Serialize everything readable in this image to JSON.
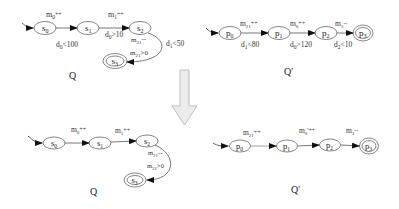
{
  "arrow": {
    "direction": "down",
    "color": "#e6e6e6",
    "stroke": "#aaaaaa"
  },
  "top_left": {
    "caption": "Q",
    "states": [
      {
        "id": "s0",
        "label": "s",
        "sub": "0",
        "x": 45,
        "y": 28,
        "final": false,
        "initial": true
      },
      {
        "id": "s1",
        "label": "s",
        "sub": "1",
        "x": 88,
        "y": 28,
        "final": false
      },
      {
        "id": "s2",
        "label": "s",
        "sub": "2",
        "x": 140,
        "y": 28,
        "final": false
      },
      {
        "id": "s3",
        "label": "s",
        "sub": "3",
        "x": 115,
        "y": 61,
        "final": true
      }
    ],
    "edges": [
      {
        "from": "s0",
        "to": "s1",
        "top": "m0++",
        "bottom": "d0<100"
      },
      {
        "from": "s1",
        "to": "s2",
        "top": "m1++",
        "bottom": "d0>10"
      },
      {
        "from": "s2",
        "to": "s3",
        "labels": [
          "m21--",
          "m21>0"
        ],
        "side": "d1<50"
      }
    ]
  },
  "top_right": {
    "caption": "Q'",
    "states": [
      {
        "id": "p0",
        "label": "p",
        "sub": "0",
        "x": 230,
        "y": 33,
        "initial": true
      },
      {
        "id": "p1",
        "label": "p",
        "sub": "1",
        "x": 279,
        "y": 33
      },
      {
        "id": "p2",
        "label": "p",
        "sub": "2",
        "x": 326,
        "y": 33
      },
      {
        "id": "p3",
        "label": "p",
        "sub": "3",
        "x": 363,
        "y": 33,
        "final": true
      }
    ],
    "edges": [
      {
        "from": "p0",
        "to": "p1",
        "top": "m21++",
        "bottom": "d1<80"
      },
      {
        "from": "p1",
        "to": "p2",
        "top": "m0++",
        "bottom": "d0>120"
      },
      {
        "from": "p2",
        "to": "p3",
        "top": "m3--",
        "bottom": "d2<10"
      }
    ]
  },
  "bottom_left": {
    "caption": "Q",
    "states": [
      {
        "id": "s0",
        "label": "s",
        "sub": "0",
        "x": 54,
        "y": 143,
        "initial": true
      },
      {
        "id": "s1",
        "label": "s",
        "sub": "1",
        "x": 100,
        "y": 143
      },
      {
        "id": "s2",
        "label": "s",
        "sub": "2",
        "x": 147,
        "y": 141
      },
      {
        "id": "s3",
        "label": "s",
        "sub": "3",
        "x": 135,
        "y": 180,
        "final": true
      }
    ],
    "edges": [
      {
        "from": "s0",
        "to": "s1",
        "top": "m0++"
      },
      {
        "from": "s1",
        "to": "s2",
        "top": "m1++"
      },
      {
        "from": "s2",
        "to": "s3",
        "labels": [
          "m21--",
          "m21>0"
        ]
      }
    ]
  },
  "bottom_right": {
    "caption": "Q'",
    "states": [
      {
        "id": "p0",
        "label": "p",
        "sub": "0",
        "x": 240,
        "y": 146,
        "initial": true
      },
      {
        "id": "p1",
        "label": "p",
        "sub": "1",
        "x": 287,
        "y": 146
      },
      {
        "id": "p2",
        "label": "p",
        "sub": "2",
        "x": 330,
        "y": 145
      },
      {
        "id": "p3",
        "label": "p",
        "sub": "3",
        "x": 369,
        "y": 146,
        "final": true
      }
    ],
    "edges": [
      {
        "from": "p0",
        "to": "p1",
        "top": "m21++"
      },
      {
        "from": "p1",
        "to": "p2",
        "top": "m0'++"
      },
      {
        "from": "p2",
        "to": "p3",
        "top": "m3--"
      }
    ]
  },
  "labels": {
    "tl_m0": "m",
    "tl_m0_sub": "0",
    "tl_m0_op": "++",
    "tl_m1": "m",
    "tl_m1_sub": "1",
    "tl_m1_op": "++",
    "tl_d0lt": "d",
    "tl_d0lt_sub": "0",
    "tl_d0lt_op": "<100",
    "tl_d0gt": "d",
    "tl_d0gt_sub": "0",
    "tl_d0gt_op": ">10",
    "tl_m21dec": "m",
    "tl_m21dec_sub": "21",
    "tl_m21dec_op": "--",
    "tl_d1": "d",
    "tl_d1_sub": "1",
    "tl_d1_op": "<50",
    "tl_m21gt": "m",
    "tl_m21gt_sub": "21",
    "tl_m21gt_op": ">0",
    "tr_m21": "m",
    "tr_m21_sub": "21",
    "tr_m21_op": "++",
    "tr_m0": "m",
    "tr_m0_sub": "0",
    "tr_m0_op": "++",
    "tr_m3": "m",
    "tr_m3_sub": "3",
    "tr_m3_op": "--",
    "tr_d1": "d",
    "tr_d1_sub": "1",
    "tr_d1_op": "<80",
    "tr_d0": "d",
    "tr_d0_sub": "0",
    "tr_d0_op": ">120",
    "tr_d2": "d",
    "tr_d2_sub": "2",
    "tr_d2_op": "<10",
    "bl_m0": "m",
    "bl_m0_sub": "0",
    "bl_m0_op": "++",
    "bl_m1": "m",
    "bl_m1_sub": "1",
    "bl_m1_op": "++",
    "bl_m21dec": "m",
    "bl_m21dec_sub": "21",
    "bl_m21dec_op": "--",
    "bl_m21gt": "m",
    "bl_m21gt_sub": "21",
    "bl_m21gt_op": ">0",
    "br_m21": "m",
    "br_m21_sub": "21",
    "br_m21_op": "++",
    "br_m0": "m",
    "br_m0_sub": "0",
    "br_m0_op": "'++",
    "br_m3": "m",
    "br_m3_sub": "3",
    "br_m3_op": "--",
    "s": "s",
    "p": "p",
    "sub0": "0",
    "sub1": "1",
    "sub2": "2",
    "sub3": "3",
    "cap_q": "Q",
    "cap_qp": "Q'"
  }
}
